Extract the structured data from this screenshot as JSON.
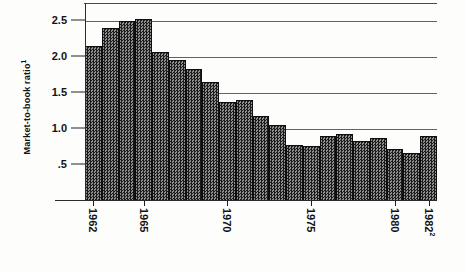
{
  "chart_data": {
    "type": "bar",
    "title": "",
    "xlabel": "",
    "ylabel": "Market-to-book ratio",
    "ylabel_superscript": "1",
    "ylim": [
      0,
      2.75
    ],
    "yticks": [
      2.5,
      2.0,
      1.5,
      1.0,
      0.5
    ],
    "ytick_labels": [
      "2.5",
      "2.0",
      "1.5",
      "1.0",
      ".5"
    ],
    "grid": true,
    "legend": null,
    "categories": [
      "1962",
      "1963",
      "1964",
      "1965",
      "1966",
      "1967",
      "1968",
      "1969",
      "1970",
      "1971",
      "1972",
      "1973",
      "1974",
      "1975",
      "1976",
      "1977",
      "1978",
      "1979",
      "1980",
      "1981",
      "1982"
    ],
    "values": [
      2.15,
      2.4,
      2.5,
      2.53,
      2.07,
      1.96,
      1.83,
      1.65,
      1.38,
      1.4,
      1.18,
      1.05,
      0.78,
      0.77,
      0.9,
      0.93,
      0.83,
      0.87,
      0.72,
      0.67,
      0.9
    ],
    "xtick_labels": [
      {
        "index": 0,
        "text": "1962",
        "superscript": ""
      },
      {
        "index": 3,
        "text": "1965",
        "superscript": ""
      },
      {
        "index": 8,
        "text": "1970",
        "superscript": ""
      },
      {
        "index": 13,
        "text": "1975",
        "superscript": ""
      },
      {
        "index": 18,
        "text": "1980",
        "superscript": ""
      },
      {
        "index": 20,
        "text": "1982",
        "superscript": "2"
      }
    ],
    "colors": {
      "bar_fill": "#3d3d3d",
      "bar_edge": "#0e0e0e",
      "axis": "#222222",
      "grid": "#63625f",
      "background": "#fdfdfb",
      "text": "#121212"
    }
  }
}
